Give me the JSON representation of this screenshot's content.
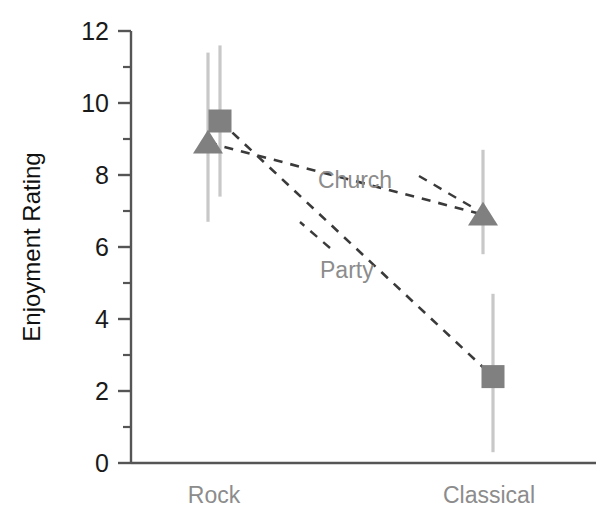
{
  "chart_data": {
    "type": "line",
    "title": "",
    "xlabel": "",
    "ylabel": "Enjoyment Rating",
    "categories": [
      "Rock",
      "Classical"
    ],
    "ylim": [
      0,
      12
    ],
    "ytick_labels": [
      "0",
      "2",
      "4",
      "6",
      "8",
      "10",
      "12"
    ],
    "ytick_values": [
      0,
      2,
      4,
      6,
      8,
      10,
      12
    ],
    "minor_ytick_values": [
      1,
      3,
      5,
      7,
      9,
      11
    ],
    "grid": false,
    "legend": "inline-labels",
    "line_style": "dashed",
    "series": [
      {
        "name": "Church",
        "marker": "triangle",
        "values": [
          8.9,
          6.9
        ],
        "error_low": [
          6.7,
          5.8
        ],
        "error_high": [
          11.4,
          8.7
        ]
      },
      {
        "name": "Party",
        "marker": "square",
        "values": [
          9.5,
          2.4
        ],
        "error_low": [
          7.4,
          0.3
        ],
        "error_high": [
          11.6,
          4.7
        ]
      }
    ],
    "colors": {
      "marker": "#808080",
      "error_bar": "#c8c8c8",
      "connector": "#3a3a3a",
      "axis": "#555555",
      "tick_text": "#1a1a1a",
      "category_text": "#8c8c8c",
      "series_label_text": "#8c8c8c",
      "axis_title_text": "#111111"
    }
  },
  "axis": {
    "y_title": "Enjoyment Rating",
    "ticks": [
      {
        "label": "12",
        "value": 12
      },
      {
        "label": "10",
        "value": 10
      },
      {
        "label": "8",
        "value": 8
      },
      {
        "label": "6",
        "value": 6
      },
      {
        "label": "4",
        "value": 4
      },
      {
        "label": "2",
        "value": 2
      },
      {
        "label": "0",
        "value": 0
      }
    ]
  },
  "categories": [
    {
      "label": "Rock"
    },
    {
      "label": "Classical"
    }
  ],
  "series_labels": [
    {
      "label": "Church"
    },
    {
      "label": "Party"
    }
  ]
}
